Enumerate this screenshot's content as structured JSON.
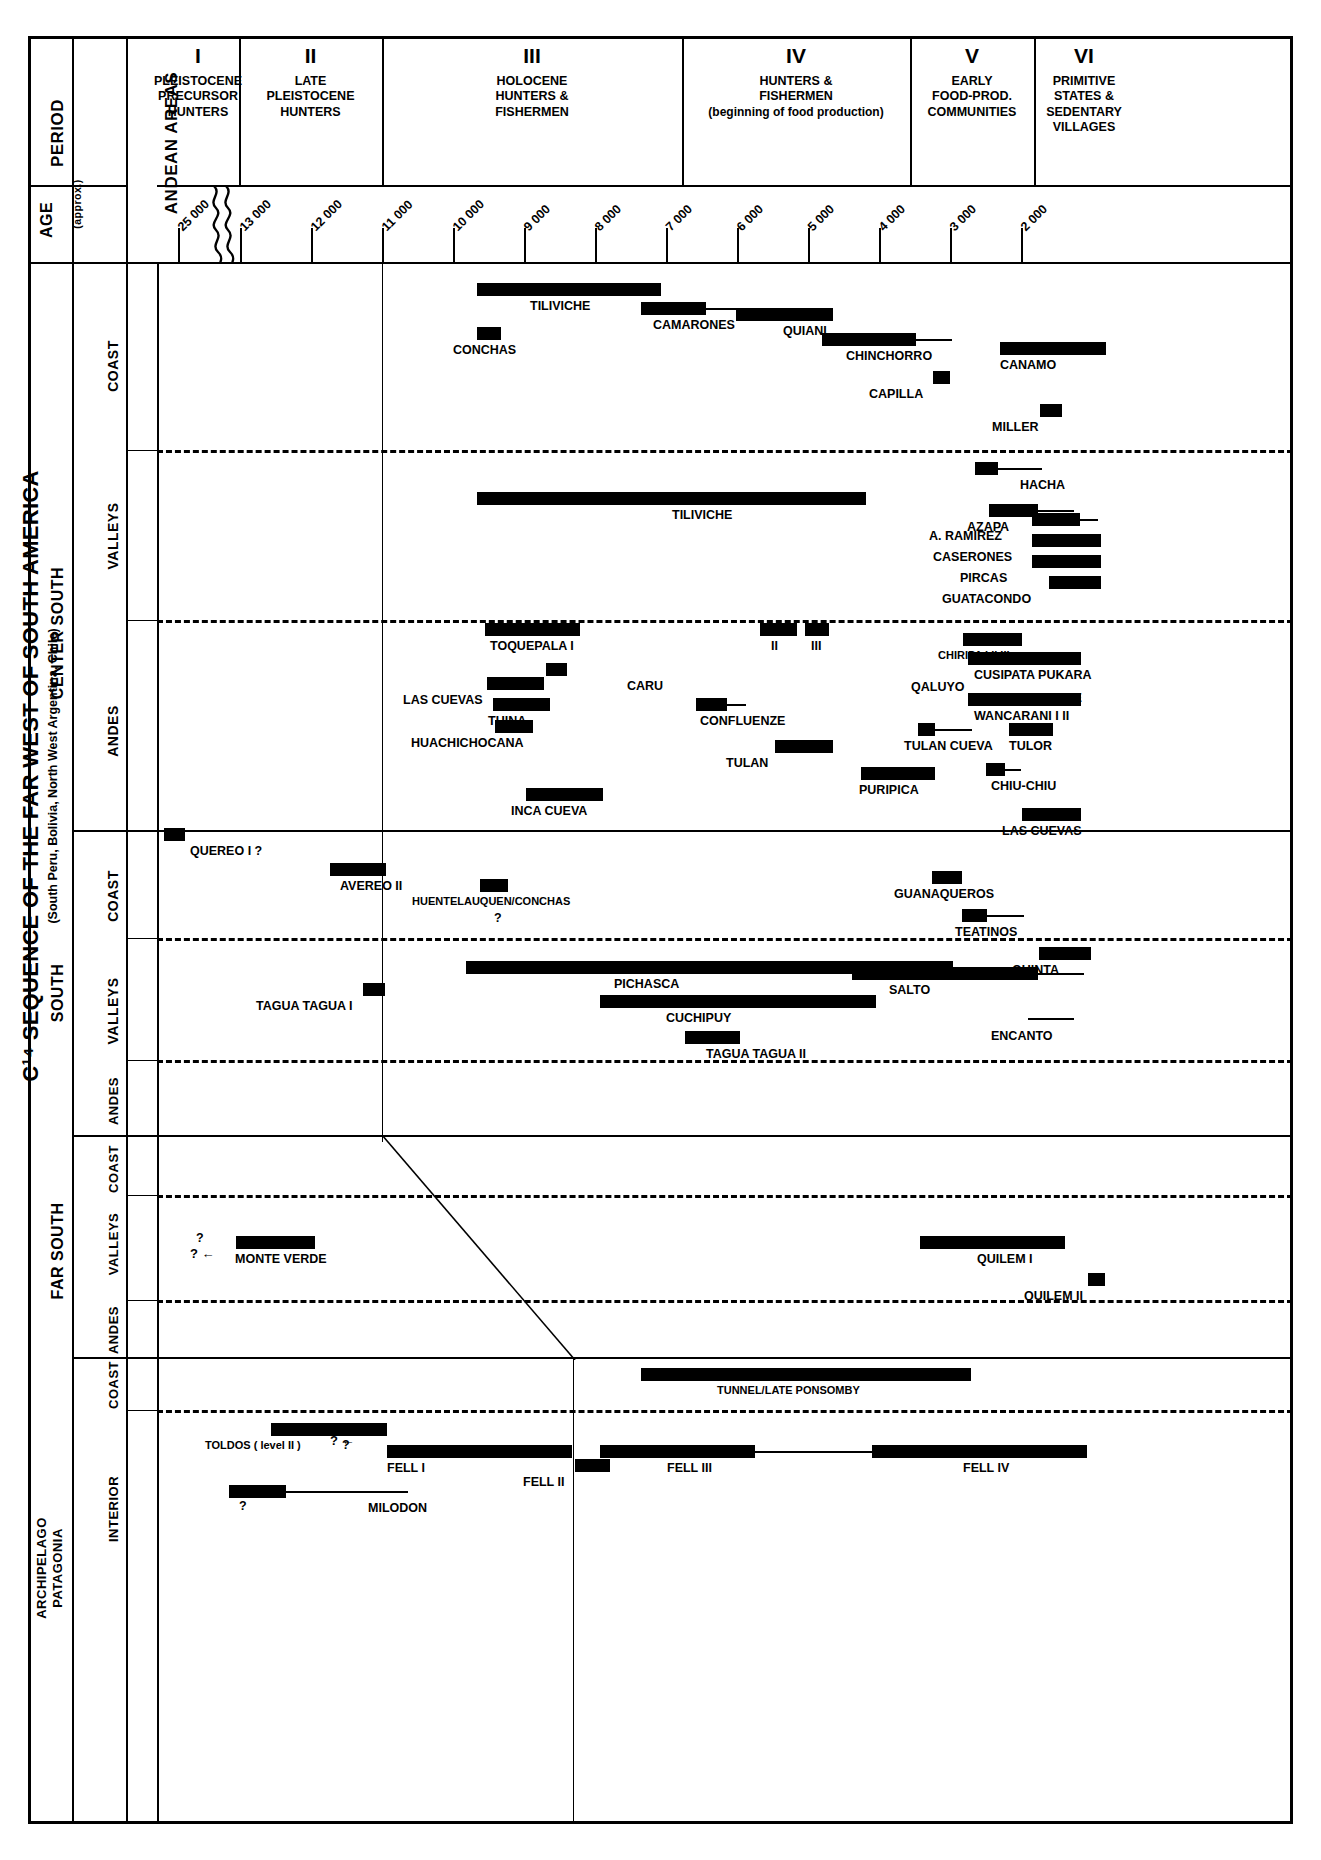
{
  "chart_data": {
    "type": "bar",
    "title": "C¹⁴ SEQUENCE OF THE FAR WEST OF SOUTH AMERICA",
    "subtitle": "(South Peru, Bolivia, North West Argentina, Chile)",
    "xlabel": "AGE (approx.)",
    "ylabel": "ANDEAN AREAS",
    "x_axis_direction": "older-to-younger (left to right), years BP",
    "tick_labels": [
      "25 000",
      "13 000",
      "12 000",
      "11 000",
      "10 000",
      "9 000",
      "8 000",
      "7 000",
      "6 000",
      "5 000",
      "4 000",
      "3 000",
      "2 000"
    ],
    "grid": false,
    "legend": "none",
    "note": "Horizontal black bars = radiocarbon-dated occupation spans; thin line extensions = inferred/uncertain continuation; '?' = uncertain date."
  },
  "header": {
    "period_label": "PERIOD",
    "areas_label": "ANDEAN AREAS",
    "age_label": "AGE",
    "age_sub": "(approx.)",
    "periods": [
      {
        "roman": "I",
        "lines": [
          "PLEISTOCENE",
          "PRECURSOR",
          "HUNTERS"
        ]
      },
      {
        "roman": "II",
        "lines": [
          "LATE",
          "PLEISTOCENE",
          "HUNTERS"
        ]
      },
      {
        "roman": "III",
        "lines": [
          "HOLOCENE",
          "HUNTERS &",
          "FISHERMEN"
        ]
      },
      {
        "roman": "IV",
        "lines": [
          "HUNTERS &",
          "FISHERMEN",
          "(beginning of food production)"
        ]
      },
      {
        "roman": "V",
        "lines": [
          "EARLY",
          "FOOD-PROD.",
          "COMMUNITIES"
        ]
      },
      {
        "roman": "VI",
        "lines": [
          "PRIMITIVE",
          "STATES &",
          "SEDENTARY",
          "VILLAGES"
        ]
      }
    ]
  },
  "title": {
    "main": "C¹⁴ SEQUENCE OF THE FAR WEST OF SOUTH AMERICA",
    "sub": "(South Peru, Bolivia, North West Argentina, Chile)"
  },
  "regions": [
    {
      "name": "CENTER  SOUTH",
      "subrows": [
        "COAST",
        "VALLEYS",
        "ANDES"
      ]
    },
    {
      "name": "SOUTH",
      "subrows": [
        "COAST",
        "VALLEYS",
        "ANDES"
      ]
    },
    {
      "name": "FAR  SOUTH",
      "subrows": [
        "COAST",
        "VALLEYS",
        "ANDES"
      ]
    },
    {
      "name": "ARCHIPELAGO PATAGONIA",
      "subrows": [
        "COAST",
        "INTERIOR"
      ]
    }
  ],
  "axis_ticks": [
    {
      "label": "25 000",
      "x": 178
    },
    {
      "label": "13 000",
      "x": 240
    },
    {
      "label": "12 000",
      "x": 311
    },
    {
      "label": "11 000",
      "x": 382
    },
    {
      "label": "10 000",
      "x": 453
    },
    {
      "label": "9 000",
      "x": 524
    },
    {
      "label": "8 000",
      "x": 595
    },
    {
      "label": "7 000",
      "x": 666
    },
    {
      "label": "6 000",
      "x": 737
    },
    {
      "label": "5 000",
      "x": 808
    },
    {
      "label": "4 000",
      "x": 879
    },
    {
      "label": "3 000",
      "x": 950
    },
    {
      "label": "2 000",
      "x": 1021
    }
  ],
  "sites": {
    "center_south_coast": [
      {
        "label": "TILIVICHE",
        "bar_x": 477,
        "bar_w": 184,
        "lab_x": 530,
        "lab_y": 300
      },
      {
        "label": "CAMARONES",
        "bar_x": 641,
        "bar_w": 65,
        "tail_w": 42,
        "lab_x": 653,
        "lab_y": 319
      },
      {
        "label": "CONCHAS",
        "bar_x": 477,
        "bar_w": 24,
        "lab_x": 453,
        "lab_y": 344
      },
      {
        "label": "QUIANI",
        "bar_x": 736,
        "bar_w": 97,
        "lab_x": 783,
        "lab_y": 325
      },
      {
        "label": "CHINCHORRO",
        "bar_x": 822,
        "bar_w": 94,
        "tail_w": 36,
        "lab_x": 846,
        "lab_y": 350
      },
      {
        "label": "CAPILLA",
        "bar_x": 933,
        "bar_w": 17,
        "lab_x": 869,
        "lab_y": 388
      },
      {
        "label": "CANAMO",
        "bar_x": 1000,
        "bar_w": 106,
        "lab_x": 1000,
        "lab_y": 359
      },
      {
        "label": "MILLER",
        "bar_x": 1040,
        "bar_w": 22,
        "lab_x": 992,
        "lab_y": 421
      }
    ],
    "center_south_valleys": [
      {
        "label": "HACHA",
        "bar_x": 975,
        "bar_w": 23,
        "tail_w": 44,
        "lab_x": 1020,
        "lab_y": 479
      },
      {
        "label": "TILIVICHE",
        "bar_x": 477,
        "bar_w": 389,
        "lab_x": 672,
        "lab_y": 509
      },
      {
        "label": "AZAPA",
        "bar_x": 989,
        "bar_w": 49,
        "tail_w": 36,
        "lab_x": 967,
        "lab_y": 521
      },
      {
        "label": "A. RAMIREZ",
        "bar_x": 1032,
        "bar_w": 48,
        "tail_w": 18,
        "lab_x": 929,
        "lab_y": 530
      },
      {
        "label": "CASERONES",
        "bar_x": 1032,
        "bar_w": 69,
        "lab_x": 933,
        "lab_y": 551
      },
      {
        "label": "PIRCAS",
        "bar_x": 1032,
        "bar_w": 69,
        "lab_x": 960,
        "lab_y": 572
      },
      {
        "label": "GUATACONDO",
        "bar_x": 1049,
        "bar_w": 52,
        "lab_x": 942,
        "lab_y": 593
      }
    ],
    "center_south_andes": [
      {
        "label": "TOQUEPALA  I",
        "bar_x": 485,
        "bar_w": 95,
        "lab_x": 490,
        "lab_y": 640
      },
      {
        "label": "II",
        "bar_x": 760,
        "bar_w": 37,
        "lab_x": 771,
        "lab_y": 640
      },
      {
        "label": "III",
        "bar_x": 805,
        "bar_w": 24,
        "lab_x": 811,
        "lab_y": 640
      },
      {
        "label": "CARU",
        "bar_x": 546,
        "bar_w": 21,
        "lab_x": 627,
        "lab_y": 680
      },
      {
        "label": "LAS CUEVAS",
        "bar_x": 487,
        "bar_w": 57,
        "lab_x": 403,
        "lab_y": 694
      },
      {
        "label": "CHIRIPA I  II  III",
        "bar_x": 963,
        "bar_w": 59,
        "lab_x": 938,
        "lab_y": 650
      },
      {
        "label": "QALUYO",
        "bar_x": 0,
        "bar_w": 0,
        "lab_x": 911,
        "lab_y": 681
      },
      {
        "label": "CUSIPATA PUKARA",
        "bar_x": 968,
        "bar_w": 113,
        "lab_x": 974,
        "lab_y": 669
      },
      {
        "label": "EARLY & MIDDLE",
        "bar_x": 0,
        "bar_w": 0,
        "lab_x": 977,
        "lab_y": 692
      },
      {
        "label": "WANCARANI I  II",
        "bar_x": 968,
        "bar_w": 113,
        "lab_x": 974,
        "lab_y": 710
      },
      {
        "label": "TUINA",
        "bar_x": 493,
        "bar_w": 57,
        "lab_x": 488,
        "lab_y": 715
      },
      {
        "label": "CONFLUENZE",
        "bar_x": 696,
        "bar_w": 31,
        "tail_w": 19,
        "lab_x": 700,
        "lab_y": 715
      },
      {
        "label": "HUACHICHOCANA",
        "bar_x": 495,
        "bar_w": 38,
        "lab_x": 411,
        "lab_y": 737
      },
      {
        "label": "TULAN",
        "bar_x": 775,
        "bar_w": 58,
        "lab_x": 726,
        "lab_y": 757
      },
      {
        "label": "TULAN CUEVA",
        "bar_x": 918,
        "bar_w": 17,
        "tail_w": 37,
        "lab_x": 904,
        "lab_y": 740
      },
      {
        "label": "TULOR",
        "bar_x": 1009,
        "bar_w": 44,
        "lab_x": 1009,
        "lab_y": 740
      },
      {
        "label": "PURIPICA",
        "bar_x": 861,
        "bar_w": 74,
        "lab_x": 859,
        "lab_y": 784
      },
      {
        "label": "CHIU-CHIU",
        "bar_x": 986,
        "bar_w": 19,
        "tail_w": 16,
        "lab_x": 991,
        "lab_y": 780
      },
      {
        "label": "INCA CUEVA",
        "bar_x": 526,
        "bar_w": 77,
        "lab_x": 511,
        "lab_y": 805
      },
      {
        "label": "LAS CUEVAS",
        "bar_x": 1022,
        "bar_w": 59,
        "lab_x": 1002,
        "lab_y": 825
      }
    ],
    "south_coast": [
      {
        "label": "QUEREO I ?",
        "bar_x": 164,
        "bar_w": 21,
        "lab_x": 190,
        "lab_y": 845
      },
      {
        "label": "AVEREO II",
        "bar_x": 330,
        "bar_w": 56,
        "lab_x": 340,
        "lab_y": 880
      },
      {
        "label": "HUENTELAUQUEN/CONCHAS",
        "bar_x": 480,
        "bar_w": 28,
        "lab_x": 412,
        "lab_y": 896
      },
      {
        "label": "?",
        "bar_x": 0,
        "bar_w": 0,
        "lab_x": 494,
        "lab_y": 912
      },
      {
        "label": "GUANAQUEROS",
        "bar_x": 932,
        "bar_w": 30,
        "lab_x": 894,
        "lab_y": 888
      },
      {
        "label": "TEATINOS",
        "bar_x": 962,
        "bar_w": 25,
        "tail_w": 37,
        "lab_x": 955,
        "lab_y": 926
      }
    ],
    "south_valleys": [
      {
        "label": "PICHASCA",
        "bar_x": 466,
        "bar_w": 487,
        "lab_x": 614,
        "lab_y": 978
      },
      {
        "label": "QUINTA",
        "bar_x": 1039,
        "bar_w": 52,
        "lab_x": 1012,
        "lab_y": 964
      },
      {
        "label": "TAGUA TAGUA I",
        "bar_x": 363,
        "bar_w": 22,
        "lab_x": 256,
        "lab_y": 1000
      },
      {
        "label": "SALTO",
        "bar_x": 852,
        "bar_w": 186,
        "tail_w": 46,
        "lab_x": 889,
        "lab_y": 984
      },
      {
        "label": "CUCHIPUY",
        "bar_x": 600,
        "bar_w": 276,
        "lab_x": 666,
        "lab_y": 1012
      },
      {
        "label": "ENCANTO",
        "bar_x": 0,
        "bar_w": 0,
        "tail_w": 46,
        "lab_x": 991,
        "lab_y": 1030
      },
      {
        "label": "TAGUA TAGUA II",
        "bar_x": 685,
        "bar_w": 55,
        "lab_x": 706,
        "lab_y": 1048
      }
    ],
    "far_south_valleys": [
      {
        "label": "MONTE VERDE",
        "bar_x": 236,
        "bar_w": 79,
        "lab_x": 235,
        "lab_y": 1253
      },
      {
        "label": "?",
        "bar_x": 0,
        "bar_w": 0,
        "lab_x": 196,
        "lab_y": 1232
      },
      {
        "label": "QUILEM I",
        "bar_x": 920,
        "bar_w": 145,
        "lab_x": 977,
        "lab_y": 1253
      },
      {
        "label": "QUILEM II",
        "bar_x": 1088,
        "bar_w": 17,
        "lab_x": 1024,
        "lab_y": 1290
      }
    ],
    "patagonia_coast": [
      {
        "label": "TUNNEL/LATE PONSOMBY",
        "bar_x": 641,
        "bar_w": 330,
        "lab_x": 717,
        "lab_y": 1385
      }
    ],
    "patagonia_interior": [
      {
        "label": "TOLDOS ( level II )",
        "bar_x": 271,
        "bar_w": 116,
        "lab_x": 205,
        "lab_y": 1440
      },
      {
        "label": "?",
        "bar_x": 0,
        "bar_w": 0,
        "lab_x": 342,
        "lab_y": 1439
      },
      {
        "label": "FELL I",
        "bar_x": 387,
        "bar_w": 185,
        "lab_x": 387,
        "lab_y": 1462
      },
      {
        "label": "FELL II",
        "bar_x": 575,
        "bar_w": 35,
        "lab_x": 523,
        "lab_y": 1476
      },
      {
        "label": "FELL III",
        "bar_x": 600,
        "bar_w": 155,
        "tail_w": 118,
        "lab_x": 667,
        "lab_y": 1462
      },
      {
        "label": "FELL IV",
        "bar_x": 872,
        "bar_w": 215,
        "lab_x": 963,
        "lab_y": 1462
      },
      {
        "label": "MILODON",
        "bar_x": 229,
        "bar_w": 57,
        "tail_w": 122,
        "lab_x": 368,
        "lab_y": 1502
      },
      {
        "label": "?",
        "bar_x": 0,
        "bar_w": 0,
        "lab_x": 239,
        "lab_y": 1500
      }
    ]
  }
}
